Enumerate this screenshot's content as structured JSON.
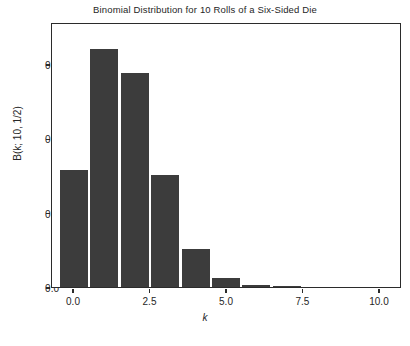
{
  "chart_data": {
    "type": "bar",
    "title": "Binomial Distribution for 10 Rolls of a Six-Sided Die",
    "xlabel": "k",
    "ylabel": "B(k; 10, 1/2)",
    "categories": [
      "0",
      "1",
      "2",
      "3",
      "4",
      "5",
      "6",
      "7",
      "8",
      "9",
      "10"
    ],
    "x": [
      0,
      1,
      2,
      3,
      4,
      5,
      6,
      7,
      8,
      9,
      10
    ],
    "values": [
      0.159,
      0.323,
      0.29,
      0.152,
      0.051,
      0.012,
      0.003,
      0.001,
      0.0,
      0.0,
      0.0
    ],
    "xlim": [
      -0.72,
      10.72
    ],
    "ylim": [
      0.0,
      0.3566
    ],
    "xticks": [
      0.0,
      2.5,
      5.0,
      7.5,
      10.0
    ],
    "xticklabels": [
      "0.0",
      "2.5",
      "5.0",
      "7.5",
      "10.0"
    ],
    "yticks": [
      0.0,
      0.1,
      0.2,
      0.3
    ],
    "yticklabels": [
      "0.0",
      "0.1",
      "0.2",
      "0.3"
    ],
    "grid": false,
    "legend": null,
    "bar_color": "#3c3c3c",
    "bar_width": 0.92,
    "axes_color": "#2b2b2b",
    "background": "#ffffff"
  }
}
